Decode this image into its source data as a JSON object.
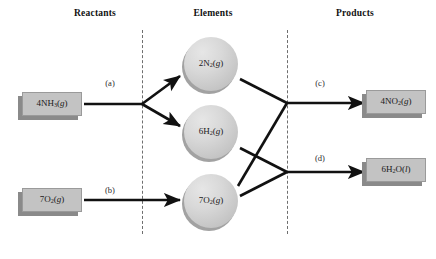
{
  "diagram": {
    "columns": [
      {
        "id": "reactants",
        "label": "Reactants",
        "x": 95
      },
      {
        "id": "elements",
        "label": "Elements",
        "x": 213
      },
      {
        "id": "products",
        "label": "Products",
        "x": 355
      }
    ],
    "dividers": [
      {
        "id": "divider-reactants-elements",
        "x": 142,
        "y_top": 30,
        "y_bottom": 234
      },
      {
        "id": "divider-elements-products",
        "x": 287,
        "y_top": 30,
        "y_bottom": 234
      }
    ],
    "reactants": [
      {
        "id": "nh3",
        "formula_html": "4NH<sub>3</sub>(<span class=\"it\">g</span>)",
        "formula_text": "4NH3(g)",
        "x": 52,
        "y": 104
      },
      {
        "id": "o2-reactant",
        "formula_html": "7O<sub>2</sub>(<span class=\"it\">g</span>)",
        "formula_text": "7O2(g)",
        "x": 52,
        "y": 200
      }
    ],
    "elements": [
      {
        "id": "n2",
        "formula_html": "2N<sub>2</sub>(<span class=\"it\">g</span>)",
        "formula_text": "2N2(g)",
        "x": 211,
        "y": 64
      },
      {
        "id": "h2",
        "formula_html": "6H<sub>2</sub>(<span class=\"it\">g</span>)",
        "formula_text": "6H2(g)",
        "x": 211,
        "y": 132
      },
      {
        "id": "o2-element",
        "formula_html": "7O<sub>2</sub>(<span class=\"it\">g</span>)",
        "formula_text": "7O2(g)",
        "x": 211,
        "y": 201
      }
    ],
    "products": [
      {
        "id": "no2",
        "formula_html": "4NO<sub>2</sub>(<span class=\"it\">g</span>)",
        "formula_text": "4NO2(g)",
        "x": 396,
        "y": 102
      },
      {
        "id": "h2o",
        "formula_html": "6H<sub>2</sub>O(<span class=\"it\">l</span>)",
        "formula_text": "6H2O(l)",
        "x": 396,
        "y": 170
      }
    ],
    "edge_labels": [
      {
        "id": "step-a",
        "label": "(a)",
        "x": 110,
        "y": 83
      },
      {
        "id": "step-b",
        "label": "(b)",
        "x": 110,
        "y": 190
      },
      {
        "id": "step-c",
        "label": "(c)",
        "x": 320,
        "y": 83
      },
      {
        "id": "step-d",
        "label": "(d)",
        "x": 320,
        "y": 158
      }
    ],
    "colors": {
      "box_face": "#c3c3c3",
      "box_shadow": "#8a8a8a",
      "sphere": "#d8d8d8",
      "edge": "#111111",
      "divider": "#6e6e6e",
      "background": "#ffffff"
    }
  }
}
